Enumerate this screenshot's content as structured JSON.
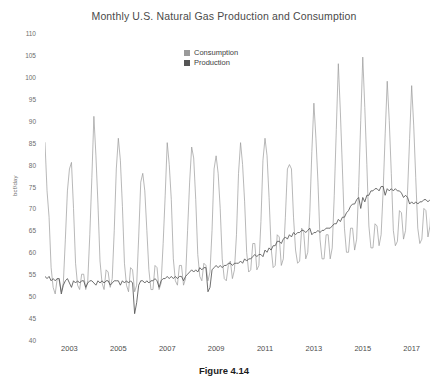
{
  "figure": {
    "caption": "Figure 4.14"
  },
  "chart_data": {
    "type": "line",
    "title": "Monthly U.S. Natural Gas Production and Consumption",
    "xlabel": "",
    "ylabel": "bcf/day",
    "ylim": [
      40,
      110
    ],
    "y_ticks": [
      110,
      105,
      100,
      95,
      90,
      85,
      80,
      75,
      70,
      65,
      60,
      55,
      50,
      45,
      40
    ],
    "x_ticks": [
      2003,
      2005,
      2007,
      2009,
      2011,
      2013,
      2015,
      2017
    ],
    "xlim": [
      2002.0,
      2017.75
    ],
    "grid": false,
    "legend_position": "top-center",
    "colors": {
      "consumption": "#9a9a9a",
      "production": "#555555",
      "axis_text": "#6d6d6d",
      "title_text": "#4a4a4a",
      "caption_text": "#1c1c1c",
      "background": "#ffffff"
    },
    "x_start": 2002.0,
    "x_step": 0.08333333,
    "series": [
      {
        "name": "Consumption",
        "color": "#9a9a9a",
        "values": [
          85.0,
          74.0,
          68.0,
          56.5,
          52.0,
          50.5,
          54.0,
          53.5,
          51.0,
          53.0,
          63.0,
          74.0,
          79.0,
          80.5,
          70.0,
          57.5,
          52.5,
          51.5,
          55.0,
          55.0,
          51.5,
          53.5,
          64.0,
          77.0,
          91.0,
          82.0,
          71.0,
          58.0,
          53.0,
          51.5,
          56.0,
          55.5,
          52.0,
          54.0,
          65.0,
          79.0,
          86.0,
          81.0,
          70.5,
          57.5,
          52.5,
          51.0,
          56.5,
          56.0,
          51.0,
          52.5,
          63.5,
          76.0,
          78.0,
          74.0,
          65.0,
          56.0,
          51.5,
          51.5,
          57.0,
          56.5,
          51.5,
          53.0,
          62.0,
          73.0,
          85.0,
          80.0,
          72.0,
          58.5,
          53.5,
          52.5,
          57.0,
          57.0,
          52.5,
          54.0,
          65.0,
          76.0,
          84.0,
          81.5,
          72.0,
          59.5,
          54.5,
          53.5,
          57.5,
          57.0,
          53.5,
          55.5,
          65.0,
          79.0,
          82.0,
          78.0,
          70.0,
          58.5,
          54.0,
          53.5,
          57.0,
          58.0,
          54.0,
          56.0,
          64.0,
          78.0,
          85.0,
          80.0,
          71.5,
          60.0,
          55.5,
          56.0,
          62.0,
          62.0,
          56.0,
          57.0,
          67.0,
          81.0,
          86.0,
          82.0,
          72.5,
          61.0,
          56.5,
          57.0,
          64.0,
          63.5,
          57.0,
          58.5,
          68.0,
          79.0,
          80.0,
          79.0,
          68.0,
          60.5,
          57.5,
          58.0,
          65.5,
          64.5,
          58.5,
          60.0,
          69.0,
          83.0,
          94.0,
          86.0,
          76.0,
          63.0,
          58.5,
          58.5,
          64.0,
          64.0,
          58.5,
          61.0,
          73.0,
          88.0,
          103.0,
          92.0,
          79.0,
          65.5,
          60.0,
          60.0,
          65.5,
          65.5,
          60.5,
          63.0,
          75.0,
          90.0,
          104.5,
          93.0,
          80.0,
          66.0,
          61.0,
          61.0,
          66.5,
          66.0,
          61.5,
          64.0,
          74.0,
          87.0,
          99.0,
          90.0,
          78.0,
          65.0,
          61.5,
          62.5,
          69.5,
          69.0,
          63.0,
          65.0,
          74.0,
          86.0,
          98.0,
          89.0,
          77.0,
          65.5,
          62.0,
          63.0,
          70.0,
          69.5,
          63.5,
          66.0,
          75.0,
          88.0
        ]
      },
      {
        "name": "Production",
        "color": "#555555",
        "values": [
          54.5,
          54.0,
          54.5,
          53.5,
          54.0,
          53.5,
          54.0,
          54.0,
          50.5,
          52.5,
          53.5,
          54.0,
          53.0,
          52.0,
          53.5,
          53.0,
          53.5,
          53.0,
          53.5,
          53.5,
          52.0,
          53.0,
          53.5,
          53.5,
          53.0,
          52.5,
          53.5,
          53.0,
          53.5,
          53.0,
          53.5,
          53.5,
          52.5,
          53.0,
          53.5,
          53.5,
          53.5,
          52.5,
          53.5,
          53.0,
          53.5,
          53.0,
          53.5,
          53.0,
          46.0,
          48.5,
          52.5,
          53.5,
          53.5,
          53.0,
          53.5,
          53.0,
          53.5,
          53.5,
          54.0,
          53.5,
          52.0,
          53.5,
          54.0,
          54.0,
          54.5,
          54.0,
          54.5,
          54.0,
          54.5,
          54.0,
          54.5,
          54.5,
          53.5,
          54.5,
          55.0,
          55.5,
          56.0,
          55.5,
          56.0,
          55.5,
          56.5,
          56.0,
          56.5,
          56.5,
          51.0,
          52.0,
          56.0,
          56.5,
          57.0,
          56.5,
          57.0,
          56.5,
          57.0,
          57.0,
          57.5,
          57.5,
          57.0,
          57.5,
          57.5,
          57.5,
          58.0,
          57.5,
          58.5,
          58.0,
          58.5,
          58.5,
          59.0,
          59.5,
          59.0,
          59.5,
          59.5,
          59.0,
          60.5,
          60.0,
          61.0,
          60.5,
          61.5,
          61.5,
          62.5,
          62.5,
          62.0,
          63.0,
          63.5,
          63.0,
          64.0,
          63.5,
          64.5,
          64.0,
          64.5,
          64.5,
          65.0,
          65.0,
          64.5,
          65.0,
          65.5,
          64.0,
          64.5,
          64.5,
          65.0,
          64.5,
          65.0,
          65.0,
          65.5,
          65.5,
          65.5,
          66.0,
          66.5,
          66.5,
          67.5,
          67.0,
          68.0,
          68.0,
          69.0,
          69.5,
          70.5,
          71.0,
          71.0,
          72.0,
          72.5,
          70.0,
          72.5,
          71.5,
          73.0,
          73.0,
          74.0,
          74.0,
          74.5,
          74.5,
          74.0,
          75.0,
          75.0,
          73.0,
          74.5,
          74.0,
          74.5,
          74.0,
          74.5,
          74.0,
          74.0,
          73.5,
          72.5,
          73.0,
          72.5,
          71.0,
          71.5,
          71.0,
          71.5,
          71.0,
          71.5,
          71.5,
          72.0,
          72.0,
          71.5,
          72.0,
          72.0,
          71.5
        ]
      }
    ]
  }
}
